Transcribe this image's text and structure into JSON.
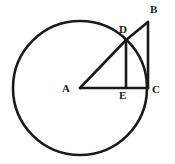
{
  "figure": {
    "background_color": "#ffffff",
    "stroke_color": "#1a1a1a",
    "width": 175,
    "height": 164
  },
  "circle": {
    "name": "circle-centered-at-A",
    "center_label": "A",
    "cx": 80,
    "cy": 88,
    "r": 67,
    "stroke_width": 2.6
  },
  "points": {
    "A": {
      "label": "A",
      "x": 80,
      "y": 88,
      "label_x": 62,
      "label_y": 83,
      "role": "circle-center"
    },
    "B": {
      "label": "B",
      "x": 148,
      "y": 22,
      "label_x": 150,
      "label_y": 4,
      "role": "apex-of-right-triangle"
    },
    "C": {
      "label": "C",
      "x": 148,
      "y": 88,
      "label_x": 152,
      "label_y": 84,
      "role": "right-angle-vertex-on-circle"
    },
    "D": {
      "label": "D",
      "x": 126,
      "y": 40,
      "label_x": 119,
      "label_y": 24,
      "role": "point-on-circle"
    },
    "E": {
      "label": "E",
      "x": 126,
      "y": 88,
      "label_x": 119,
      "label_y": 90,
      "role": "foot-of-perpendicular"
    }
  },
  "segments": [
    {
      "name": "segment-AC",
      "from": "A",
      "to": "C",
      "stroke_width": 2.6,
      "description": "radius extended to C"
    },
    {
      "name": "segment-AD",
      "from": "A",
      "to": "D",
      "stroke_width": 2.6,
      "description": "radius to D"
    },
    {
      "name": "segment-DB",
      "from": "D",
      "to": "B",
      "stroke_width": 2.6,
      "description": "from D up to B"
    },
    {
      "name": "segment-BC",
      "from": "B",
      "to": "C",
      "stroke_width": 2.6,
      "description": "vertical leg of triangle"
    },
    {
      "name": "segment-DE",
      "from": "D",
      "to": "E",
      "stroke_width": 2.6,
      "description": "perpendicular from D to AC"
    }
  ],
  "labels": [
    "A",
    "B",
    "C",
    "D",
    "E"
  ]
}
